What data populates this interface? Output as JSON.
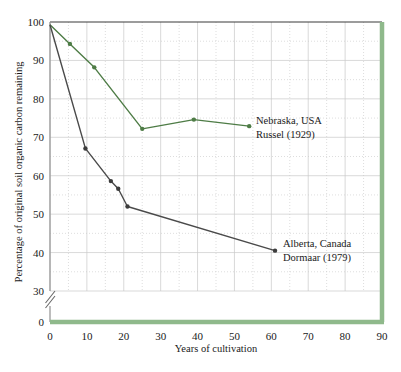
{
  "chart_data": {
    "type": "line",
    "title": "",
    "xlabel": "Years of cultivation",
    "ylabel": "Percentage of original soil organic carbon remaining",
    "xlim": [
      0,
      90
    ],
    "ylim": [
      30,
      100
    ],
    "y_axis_break": true,
    "y_break_baseline": 0,
    "grid": true,
    "grid_major_step_x": 10,
    "grid_minor_step_x": 5,
    "grid_major_step_y": 10,
    "grid_minor_step_y": 5,
    "legend_position": "inline-annotations",
    "xticks": [
      0,
      10,
      20,
      30,
      40,
      50,
      60,
      70,
      80,
      90
    ],
    "xtick_labels": [
      "0",
      "10",
      "20",
      "30",
      "40",
      "50",
      "60",
      "70",
      "80",
      "90"
    ],
    "yticks": [
      0,
      30,
      40,
      50,
      60,
      70,
      80,
      90,
      100
    ],
    "ytick_labels": [
      "0",
      "30",
      "40",
      "50",
      "60",
      "70",
      "80",
      "90",
      "100"
    ],
    "series": [
      {
        "name": "Nebraska, USA Russel (1929)",
        "label_line1": "Nebraska, USA",
        "label_line2": "Russel (1929)",
        "color": "#4e7c46",
        "x": [
          0,
          5.4,
          12,
          25,
          39,
          54
        ],
        "values": [
          99.3,
          94.3,
          88.2,
          72.2,
          74.6,
          72.9
        ]
      },
      {
        "name": "Alberta, Canada Dormaar (1979)",
        "label_line1": "Alberta, Canada",
        "label_line2": "Dormaar (1979)",
        "color": "#3c3c3c",
        "x": [
          0,
          9.6,
          16.5,
          18.5,
          21,
          61
        ],
        "values": [
          99.3,
          67.1,
          58.6,
          56.6,
          52.0,
          40.5
        ]
      }
    ]
  },
  "axes": {
    "x_title": "Years of cultivation",
    "y_title": "Percentage of original soil organic carbon remaining"
  },
  "annotations": {
    "nebraska_line1": "Nebraska, USA",
    "nebraska_line2": "Russel (1929)",
    "alberta_line1": "Alberta, Canada",
    "alberta_line2": "Dormaar (1979)"
  },
  "colors": {
    "series_green": "#4e7c46",
    "series_black": "#3c3c3c",
    "frame_green": "#8fb98b",
    "grid": "#c9c9c9",
    "background": "#ffffff"
  }
}
